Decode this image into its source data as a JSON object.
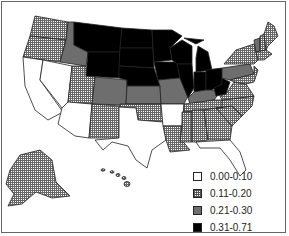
{
  "map": {
    "region": "United States (incl. Alaska and Hawaii)",
    "type": "choropleth",
    "colors": {
      "class1": "#ffffff",
      "class2": "hatched",
      "class3": "#6e6e6e",
      "class4": "#000000"
    }
  },
  "legend": {
    "items": [
      {
        "label": "0.00-0.10",
        "style": "white"
      },
      {
        "label": "0.11-0.20",
        "style": "hatch"
      },
      {
        "label": "0.21-0.30",
        "style": "gray"
      },
      {
        "label": "0.31-0.71",
        "style": "black"
      }
    ]
  },
  "states": {
    "0.00-0.10": [
      "CA",
      "NV",
      "AZ",
      "TX",
      "AR",
      "FL"
    ],
    "0.11-0.20": [
      "WA",
      "OR",
      "UT",
      "NM",
      "OK",
      "LA",
      "MS",
      "AL",
      "GA",
      "SC",
      "NC",
      "VA",
      "TN",
      "NY",
      "ME",
      "NH",
      "MA",
      "CT",
      "RI",
      "NJ",
      "MD",
      "DE",
      "AK",
      "HI"
    ],
    "0.21-0.30": [
      "ID",
      "CO",
      "KS",
      "MO",
      "KY",
      "PA",
      "VT"
    ],
    "0.31-0.71": [
      "MT",
      "WY",
      "ND",
      "SD",
      "NE",
      "MN",
      "IA",
      "WI",
      "IL",
      "MI",
      "IN",
      "OH",
      "WV"
    ]
  }
}
